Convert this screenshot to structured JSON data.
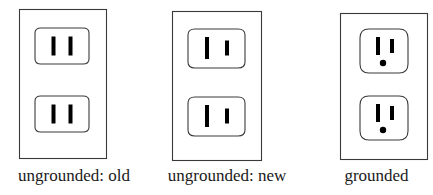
{
  "figure": {
    "background_color": "#ffffff",
    "line_color": "#333333",
    "slot_color": "#000000",
    "plate_fill": "#ffffff"
  },
  "outlets": [
    {
      "id": "ungrounded-old",
      "caption": "ungrounded: old",
      "plate": {
        "width": 88,
        "height": 150
      },
      "socket_shape": "rounded-rectangle",
      "receptacles": 2,
      "grounded": false,
      "polarized": false,
      "slots": [
        {
          "name": "left-slot",
          "role": "blade",
          "width": 4,
          "height": 19
        },
        {
          "name": "right-slot",
          "role": "blade",
          "width": 4,
          "height": 19
        }
      ],
      "ground_hole": null
    },
    {
      "id": "ungrounded-new",
      "caption": "ungrounded: new",
      "plate": {
        "width": 90,
        "height": 150
      },
      "socket_shape": "rounded-rectangle",
      "receptacles": 2,
      "grounded": false,
      "polarized": true,
      "slots": [
        {
          "name": "left-slot",
          "role": "neutral",
          "width": 4,
          "height": 22
        },
        {
          "name": "right-slot",
          "role": "hot",
          "width": 4,
          "height": 15
        }
      ],
      "ground_hole": null
    },
    {
      "id": "grounded",
      "caption": "grounded",
      "plate": {
        "width": 88,
        "height": 147
      },
      "socket_shape": "squircle",
      "receptacles": 2,
      "grounded": true,
      "polarized": true,
      "slots": [
        {
          "name": "left-slot",
          "role": "neutral",
          "width": 4,
          "height": 18
        },
        {
          "name": "right-slot",
          "role": "hot",
          "width": 4,
          "height": 14
        }
      ],
      "ground_hole": {
        "name": "ground-hole",
        "shape": "circle",
        "diameter": 6
      }
    }
  ]
}
